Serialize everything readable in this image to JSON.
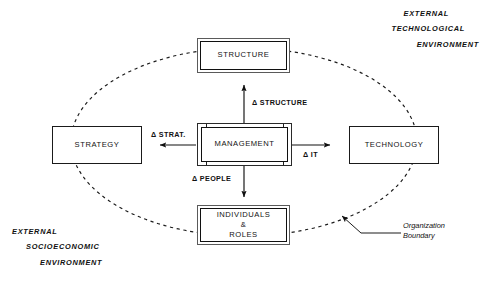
{
  "diagram": {
    "background_color": "#ffffff",
    "line_color": "#101010",
    "boundary_style": "dashed-ellipse"
  },
  "nodes": {
    "center": {
      "label": "MANAGEMENT",
      "style": "railed-box"
    },
    "top": {
      "label": "STRUCTURE",
      "style": "double-box"
    },
    "left": {
      "label": "STRATEGY",
      "style": "single-box"
    },
    "right": {
      "label": "TECHNOLOGY",
      "style": "single-box"
    },
    "bottom": {
      "label": "INDIVIDUALS\n&\nROLES",
      "style": "double-box"
    }
  },
  "arrows": [
    {
      "id": "to-structure",
      "label": "Δ STRUCTURE",
      "direction": "up",
      "from": "center",
      "to": "top"
    },
    {
      "id": "to-strategy",
      "label": "Δ STRAT.",
      "direction": "left",
      "from": "center",
      "to": "left"
    },
    {
      "id": "to-technology",
      "label": "Δ IT",
      "direction": "right",
      "from": "center",
      "to": "right"
    },
    {
      "id": "to-people",
      "label": "Δ PEOPLE",
      "direction": "down",
      "from": "center",
      "to": "bottom"
    }
  ],
  "environment": {
    "technological": {
      "lines": [
        "EXTERNAL",
        "TECHNOLOGICAL",
        "ENVIRONMENT"
      ],
      "position": "top-right"
    },
    "socioeconomic": {
      "lines": [
        "EXTERNAL",
        "SOCIOECONOMIC",
        "ENVIRONMENT"
      ],
      "position": "bottom-left"
    }
  },
  "annotations": {
    "boundary": {
      "label": "Organization\nBoundary",
      "points_to": "dashed-ellipse"
    }
  }
}
